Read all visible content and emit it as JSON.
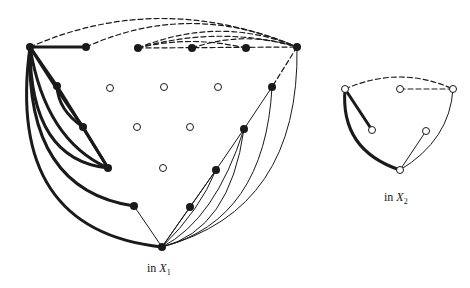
{
  "figure": {
    "colors": {
      "stroke": "#1a1a1a",
      "open_fill": "#ffffff",
      "background": "#ffffff"
    },
    "panels": [
      {
        "id": "X1",
        "caption_prefix": "in ",
        "caption_var": "X",
        "caption_sub": "1",
        "nodes": {
          "filled": [
            [
              30,
              47
            ],
            [
              86,
              47
            ],
            [
              138,
              48
            ],
            [
              192,
              48
            ],
            [
              246,
              48
            ],
            [
              297,
              47
            ],
            [
              57,
              86
            ],
            [
              272,
              87
            ],
            [
              83,
              127
            ],
            [
              244,
              129
            ],
            [
              108,
              168
            ],
            [
              216,
              170
            ],
            [
              134,
              206
            ],
            [
              190,
              207
            ],
            [
              162,
              247
            ]
          ],
          "open": [
            [
              110,
              88
            ],
            [
              164,
              87
            ],
            [
              218,
              87
            ],
            [
              137,
              127
            ],
            [
              190,
              127
            ],
            [
              163,
              168
            ]
          ]
        }
      },
      {
        "id": "X2",
        "caption_prefix": "in ",
        "caption_var": "X",
        "caption_sub": "2",
        "nodes": {
          "open": [
            [
              345,
              89
            ],
            [
              400,
              89
            ],
            [
              453,
              89
            ],
            [
              372,
              130
            ],
            [
              426,
              131
            ],
            [
              400,
              170
            ]
          ]
        }
      }
    ]
  }
}
